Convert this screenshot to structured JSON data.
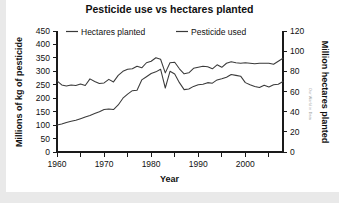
{
  "figure": {
    "title": "Pesticide use vs hectares planted",
    "watermark": "Our World in Data",
    "background_color": "#ffffff",
    "line_color": "#3a3a3a",
    "axis_color": "#1a1a1a"
  },
  "axes": {
    "x": {
      "label": "Year",
      "tick_labels": [
        "1960",
        "1970",
        "1980",
        "1990",
        "2000"
      ],
      "tick_values": [
        1960,
        1970,
        1980,
        1990,
        2000
      ],
      "minor_tick_values": [
        1965,
        1975,
        1985,
        1995,
        2005
      ],
      "range": [
        1960,
        2008
      ]
    },
    "y_left": {
      "label": "Millions of kg of pesticide",
      "tick_labels": [
        "0",
        "50",
        "100",
        "150",
        "200",
        "250",
        "300",
        "350",
        "400",
        "450"
      ],
      "tick_values": [
        0,
        50,
        100,
        150,
        200,
        250,
        300,
        350,
        400,
        450
      ],
      "range": [
        0,
        450
      ]
    },
    "y_right": {
      "label": "Million hectares planted",
      "tick_labels": [
        "0",
        "20",
        "40",
        "60",
        "80",
        "100",
        "120"
      ],
      "tick_values": [
        0,
        20,
        40,
        60,
        80,
        100,
        120
      ],
      "range": [
        0,
        120
      ]
    }
  },
  "legend": {
    "position": "top-inside",
    "entries": [
      {
        "label": "Hectares planted",
        "color": "#3a3a3a",
        "axis": "right"
      },
      {
        "label": "Pesticide used",
        "color": "#3a3a3a",
        "axis": "left"
      }
    ]
  },
  "chart_data": {
    "type": "line",
    "title": "Pesticide use vs hectares planted",
    "xlabel": "Year",
    "ylabel": "Millions of kg of pesticide",
    "ylabel_right": "Million hectares planted",
    "xlim": [
      1960,
      2008
    ],
    "ylim": [
      0,
      450
    ],
    "ylim_right": [
      0,
      120
    ],
    "grid": false,
    "legend_position": "top-inside",
    "x": [
      1960,
      1961,
      1962,
      1963,
      1964,
      1965,
      1966,
      1967,
      1968,
      1969,
      1970,
      1971,
      1972,
      1973,
      1974,
      1975,
      1976,
      1977,
      1978,
      1979,
      1980,
      1981,
      1982,
      1983,
      1984,
      1985,
      1986,
      1987,
      1988,
      1989,
      1990,
      1991,
      1992,
      1993,
      1994,
      1995,
      1996,
      1997,
      1998,
      1999,
      2000,
      2001,
      2002,
      2003,
      2004,
      2005,
      2006,
      2007,
      2008
    ],
    "series": [
      {
        "name": "Hectares planted",
        "axis": "right",
        "unit": "million hectares",
        "color": "#3a3a3a",
        "values": [
          70.5,
          66.5,
          65.5,
          66.5,
          66.0,
          67.5,
          66.0,
          72.5,
          70.0,
          68.0,
          68.5,
          72.0,
          69.5,
          76.0,
          80.0,
          82.0,
          82.5,
          85.0,
          83.5,
          88.5,
          90.0,
          93.5,
          92.0,
          78.5,
          88.5,
          89.0,
          82.5,
          77.5,
          78.5,
          83.0,
          84.0,
          85.0,
          84.5,
          82.5,
          86.5,
          84.0,
          88.0,
          89.5,
          88.5,
          88.0,
          88.5,
          88.0,
          87.5,
          88.0,
          88.0,
          88.0,
          87.0,
          90.0,
          93.0
        ]
      },
      {
        "name": "Pesticide used",
        "axis": "left",
        "unit": "millions of kg",
        "color": "#3a3a3a",
        "values": [
          100,
          104,
          110,
          114,
          118,
          124,
          130,
          136,
          143,
          150,
          158,
          160,
          158,
          175,
          200,
          215,
          228,
          230,
          268,
          280,
          292,
          298,
          308,
          238,
          300,
          290,
          258,
          232,
          234,
          244,
          250,
          252,
          258,
          256,
          268,
          272,
          278,
          288,
          285,
          282,
          258,
          250,
          244,
          240,
          248,
          242,
          250,
          252,
          262
        ]
      }
    ]
  }
}
